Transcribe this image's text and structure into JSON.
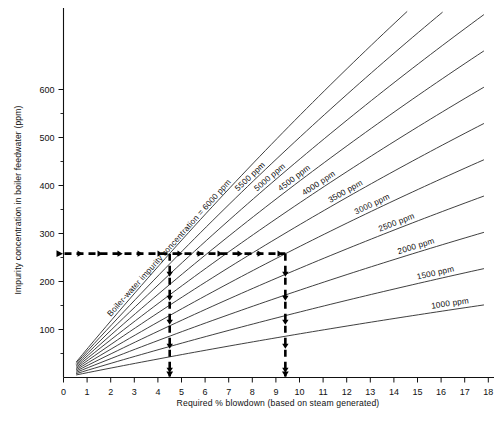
{
  "chart_data": {
    "type": "line",
    "title": "",
    "xlabel": "Required % blowdown (based on steam generated)",
    "ylabel": "Impurity concentration in boiler feedwater (ppm)",
    "xlim": [
      0,
      18
    ],
    "ylim": [
      0,
      640
    ],
    "x_ticks": [
      0,
      1,
      2,
      3,
      4,
      5,
      6,
      7,
      8,
      9,
      10,
      11,
      12,
      13,
      14,
      15,
      16,
      17,
      18
    ],
    "x_tick_labels": [
      "0",
      "1",
      "2",
      "3",
      "4",
      "5",
      "6",
      "7",
      "8",
      "9",
      "10",
      "11",
      "12",
      "13",
      "14",
      "15",
      "16",
      "17",
      "18"
    ],
    "y_ticks": [
      100,
      200,
      300,
      400,
      500,
      600
    ],
    "y_tick_labels": [
      "100",
      "200",
      "300",
      "400",
      "500",
      "600"
    ],
    "y_minor_ticks": [
      50,
      150,
      250,
      350,
      450,
      550
    ],
    "grid": false,
    "legend_position": "inline-on-curve",
    "series_label_prefix": "Boiler-water impurity concentration =",
    "units": "ppm",
    "relation": "feedwater_ppm = boiler_ppm * blowdown/(100 + blowdown)",
    "series": [
      {
        "name": "Boiler-water impurity concentration = 6000 ppm",
        "boiler_ppm": 6000,
        "label": "Boiler-water impurity concentration = 6000 ppm",
        "x": [
          0.55,
          2,
          4,
          4.5,
          6,
          8,
          9.4,
          10,
          12,
          14,
          16,
          18
        ],
        "y": [
          33,
          118,
          231,
          258,
          340,
          444,
          515,
          545,
          643,
          737,
          828,
          915
        ]
      },
      {
        "name": "5500 ppm",
        "boiler_ppm": 5500,
        "label": "5500 ppm",
        "x": [
          0.55,
          2,
          4,
          4.5,
          6,
          8,
          9.4,
          10,
          12,
          14,
          16,
          18
        ],
        "y": [
          30,
          108,
          212,
          237,
          311,
          407,
          472,
          500,
          589,
          675,
          759,
          839
        ]
      },
      {
        "name": "5000 ppm",
        "boiler_ppm": 5000,
        "label": "5000 ppm",
        "x": [
          0.55,
          2,
          4,
          4.5,
          6,
          8,
          9.4,
          10,
          12,
          14,
          16,
          18
        ],
        "y": [
          27,
          98,
          192,
          215,
          283,
          370,
          429,
          455,
          536,
          614,
          690,
          763
        ]
      },
      {
        "name": "4500 ppm",
        "boiler_ppm": 4500,
        "label": "4500 ppm",
        "x": [
          0.55,
          2,
          4,
          4.5,
          6,
          8,
          9.4,
          10,
          12,
          14,
          16,
          18
        ],
        "y": [
          25,
          88,
          173,
          194,
          255,
          333,
          386,
          409,
          482,
          553,
          621,
          686
        ]
      },
      {
        "name": "4000 ppm",
        "boiler_ppm": 4000,
        "label": "4000 ppm",
        "x": [
          0.55,
          2,
          4,
          4.5,
          6,
          8,
          9.4,
          10,
          12,
          14,
          16,
          18
        ],
        "y": [
          22,
          78,
          154,
          172,
          226,
          296,
          343,
          364,
          429,
          491,
          552,
          610
        ]
      },
      {
        "name": "3500 ppm",
        "boiler_ppm": 3500,
        "label": "3500 ppm",
        "x": [
          0.55,
          2,
          4,
          4.5,
          6,
          8,
          9.4,
          10,
          12,
          14,
          16,
          18
        ],
        "y": [
          19,
          69,
          135,
          151,
          198,
          259,
          300,
          318,
          375,
          430,
          483,
          534
        ]
      },
      {
        "name": "3000 ppm",
        "boiler_ppm": 3000,
        "label": "3000 ppm",
        "x": [
          0.55,
          2,
          4,
          4.5,
          6,
          8,
          9.4,
          10,
          12,
          14,
          16,
          18
        ],
        "y": [
          16,
          59,
          115,
          129,
          170,
          222,
          257,
          273,
          321,
          368,
          414,
          458
        ]
      },
      {
        "name": "2500 ppm",
        "boiler_ppm": 2500,
        "label": "2500 ppm",
        "x": [
          0.55,
          2,
          4,
          4.5,
          6,
          8,
          9.4,
          10,
          12,
          14,
          16,
          18
        ],
        "y": [
          14,
          49,
          96,
          108,
          142,
          185,
          215,
          227,
          268,
          307,
          345,
          381
        ]
      },
      {
        "name": "2000 ppm",
        "boiler_ppm": 2000,
        "label": "2000 ppm",
        "x": [
          0.55,
          2,
          4,
          4.5,
          6,
          8,
          9.4,
          10,
          12,
          14,
          16,
          18
        ],
        "y": [
          11,
          39,
          77,
          86,
          113,
          148,
          172,
          182,
          214,
          246,
          276,
          305
        ]
      },
      {
        "name": "1500 ppm",
        "boiler_ppm": 1500,
        "label": "1500 ppm",
        "x": [
          0.55,
          2,
          4,
          4.5,
          6,
          8,
          9.4,
          10,
          12,
          14,
          16,
          18
        ],
        "y": [
          8,
          29,
          58,
          65,
          85,
          111,
          129,
          136,
          161,
          184,
          207,
          229
        ]
      },
      {
        "name": "1000 ppm",
        "boiler_ppm": 1000,
        "label": "1000 ppm",
        "x": [
          0.55,
          2,
          4,
          4.5,
          6,
          8,
          9.4,
          10,
          12,
          14,
          16,
          18
        ],
        "y": [
          5,
          20,
          38,
          43,
          57,
          74,
          86,
          91,
          107,
          123,
          138,
          153
        ]
      }
    ],
    "annotations": [
      {
        "name": "construction-line-horizontal",
        "type": "dashed-arrow",
        "value_ppm": 258,
        "from_x": 0,
        "to_x": 9.4,
        "description": "Horizontal dashed arrow at 258 ppm feedwater impurity"
      },
      {
        "name": "construction-line-left",
        "type": "dashed-arrow-down",
        "x": 4.5,
        "from_ppm": 258,
        "to_ppm": 0,
        "description": "Vertical dashed arrow down to 4.5 % blowdown"
      },
      {
        "name": "construction-line-right",
        "type": "dashed-arrow-down",
        "x": 9.4,
        "from_ppm": 258,
        "to_ppm": 0,
        "description": "Vertical dashed arrow down to 9.4 % blowdown"
      }
    ],
    "readout": {
      "feedwater_ppm": 258,
      "blowdown_low_pct": 4.5,
      "blowdown_high_pct": 9.4
    }
  }
}
